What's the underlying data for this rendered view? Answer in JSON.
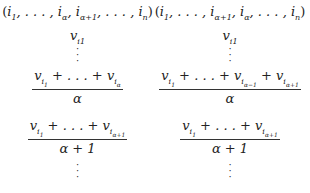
{
  "left": {
    "tuple": "(i1, . . . , iα, iα+1, . . . , in)",
    "vertex": "vi1",
    "fraction1": {
      "numerator": "vi1 + . . . + viα",
      "denominator": "α"
    },
    "fraction2": {
      "numerator": "vi1 + . . . + viα+1",
      "denominator": "α + 1"
    }
  },
  "right": {
    "tuple": "(i1, . . . , iα+1, iα, . . . , in)",
    "vertex": "vi1",
    "fraction1": {
      "numerator": "vi1 + . . . + viα−1 + viα+1",
      "denominator": "α"
    },
    "fraction2": {
      "numerator": "vi1 + . . . + viα+1",
      "denominator": "α + 1"
    }
  },
  "vdots": "⋮",
  "colors": {
    "text": "#222222",
    "background": "#ffffff"
  }
}
